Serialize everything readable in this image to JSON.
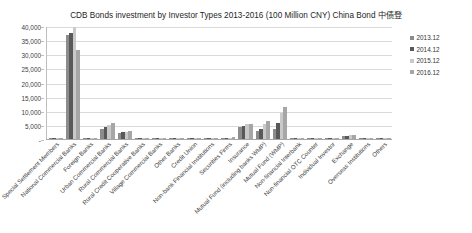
{
  "chart_data": {
    "type": "bar",
    "title": "CDB Bonds investment by Investor Types 2013-2016 (100 Million CNY) China Bond  中债登",
    "xlabel": "",
    "ylabel": "",
    "ylim": [
      0,
      40000
    ],
    "ytick_labels": [
      "40,000",
      "35,000",
      "30,000",
      "25,000",
      "20,000",
      "15,000",
      "10,000",
      "5,000",
      "-"
    ],
    "ytick_values": [
      40000,
      35000,
      30000,
      25000,
      20000,
      15000,
      10000,
      5000,
      0
    ],
    "grid": true,
    "legend_position": "right",
    "categories": [
      "Special Settlement Members",
      "National Commercial Banks",
      "Foreign Banks",
      "Urban Commercial Banks",
      "Rural Commercial Banks",
      "Rural Credit Cooperative Banks",
      "Village Commercial Banks",
      "Other Banks",
      "Credit Union",
      "Non-bank Financial Institutions",
      "Securities Firms",
      "Insurance",
      "Mutual Fund (including banks WMP)",
      "Mutual Fund (WMP)",
      "Non-financial Interbank",
      "Non-financial OTC Counter",
      "Individual Investor",
      "Exchange",
      "Overseas Institutions",
      "Others"
    ],
    "series": [
      {
        "name": "2013.12",
        "color": "#8c8c8c",
        "values": [
          330,
          36900,
          360,
          3700,
          2100,
          400,
          60,
          40,
          30,
          120,
          340,
          4200,
          3000,
          3700,
          30,
          20,
          10,
          900,
          120,
          40
        ]
      },
      {
        "name": "2014.12",
        "color": "#595959",
        "values": [
          340,
          37400,
          400,
          4300,
          2400,
          420,
          70,
          50,
          35,
          130,
          420,
          4600,
          3400,
          5500,
          35,
          25,
          12,
          1100,
          160,
          50
        ]
      },
      {
        "name": "2015.12",
        "color": "#c9c9c9",
        "values": [
          360,
          39500,
          430,
          5000,
          2600,
          430,
          80,
          60,
          40,
          140,
          520,
          5200,
          5300,
          9300,
          40,
          30,
          14,
          1300,
          200,
          60
        ]
      },
      {
        "name": "2016.12",
        "color": "#a6a6a6",
        "values": [
          300,
          31500,
          450,
          5600,
          2700,
          440,
          90,
          70,
          45,
          150,
          600,
          5400,
          6300,
          11500,
          45,
          35,
          16,
          1500,
          240,
          70
        ]
      }
    ]
  },
  "legend": {
    "items": [
      {
        "label": "2013.12"
      },
      {
        "label": "2014.12"
      },
      {
        "label": "2015.12"
      },
      {
        "label": "2016.12"
      }
    ]
  }
}
